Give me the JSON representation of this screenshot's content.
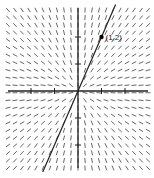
{
  "chart_data": {
    "type": "slope_field",
    "title": "",
    "equation": "dy/dx = y/x",
    "xlabel": "",
    "ylabel": "",
    "xlim": [
      -3,
      3
    ],
    "ylim": [
      -3,
      3
    ],
    "x_ticks": [
      -2,
      -1,
      1,
      2
    ],
    "y_ticks": [
      -2,
      -1,
      1,
      2
    ],
    "grid": false,
    "solution_curve": {
      "equation": "y = 2x",
      "x": [
        -1.5,
        1.6
      ],
      "y": [
        -3,
        3.2
      ]
    },
    "marked_point": {
      "x": 1,
      "y": 2,
      "label": "(1,2)"
    },
    "field_grid": {
      "cols": 21,
      "rows": 22
    }
  },
  "layout": {
    "origin_px": [
      78,
      91
    ],
    "unit_x_px": 23.5,
    "unit_y_px": 27,
    "plot_left": 8,
    "plot_right": 148,
    "plot_top": 10,
    "plot_bottom": 168,
    "segment_len": 5,
    "colors": {
      "field": "#555555",
      "axis": "#222222",
      "curve": "#222222",
      "point": "#000000"
    }
  },
  "point_label": "(1,2)"
}
